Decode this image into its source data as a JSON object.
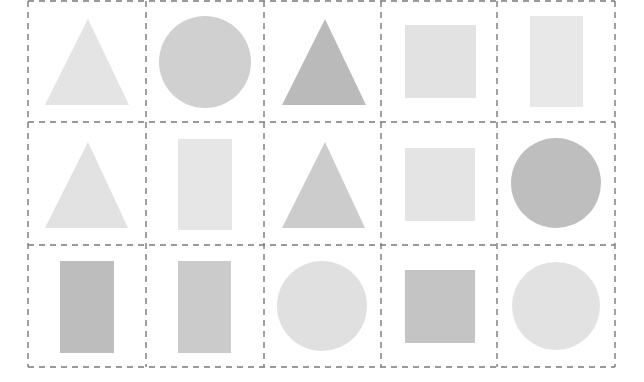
{
  "grid": {
    "rows": 3,
    "cols": 5,
    "x_lines": [
      28,
      146,
      264,
      381,
      497,
      615
    ],
    "y_lines": [
      1,
      122,
      245,
      367
    ],
    "line_color": "#7a7a7a",
    "dash": "6,5"
  },
  "cells": [
    {
      "row": 0,
      "col": 0,
      "shape": "triangle",
      "points": "88,19 45,105 129,105",
      "color": "#e4e4e4"
    },
    {
      "row": 0,
      "col": 1,
      "shape": "circle",
      "cx": 205,
      "cy": 62,
      "r": 46,
      "color": "#d0d0d0"
    },
    {
      "row": 0,
      "col": 2,
      "shape": "triangle",
      "points": "325,19 282,105 366,105",
      "color": "#bababa"
    },
    {
      "row": 0,
      "col": 3,
      "shape": "square",
      "x": 405,
      "y": 25,
      "w": 71,
      "h": 73,
      "color": "#e2e2e2"
    },
    {
      "row": 0,
      "col": 4,
      "shape": "rectangle",
      "x": 530,
      "y": 16,
      "w": 53,
      "h": 91,
      "color": "#e8e8e8"
    },
    {
      "row": 1,
      "col": 0,
      "shape": "triangle",
      "points": "88,142 45,228 128,228",
      "color": "#e2e2e2"
    },
    {
      "row": 1,
      "col": 1,
      "shape": "rectangle",
      "x": 178,
      "y": 139,
      "w": 54,
      "h": 91,
      "color": "#e6e6e6"
    },
    {
      "row": 1,
      "col": 2,
      "shape": "triangle",
      "points": "325,142 282,228 365,228",
      "color": "#cccccc"
    },
    {
      "row": 1,
      "col": 3,
      "shape": "square",
      "x": 405,
      "y": 148,
      "w": 70,
      "h": 73,
      "color": "#e4e4e4"
    },
    {
      "row": 1,
      "col": 4,
      "shape": "circle",
      "cx": 556,
      "cy": 183,
      "r": 45,
      "color": "#bebebe"
    },
    {
      "row": 2,
      "col": 0,
      "shape": "rectangle",
      "x": 60,
      "y": 261,
      "w": 54,
      "h": 92,
      "color": "#bdbdbd"
    },
    {
      "row": 2,
      "col": 1,
      "shape": "rectangle",
      "x": 178,
      "y": 261,
      "w": 53,
      "h": 92,
      "color": "#cbcbcb"
    },
    {
      "row": 2,
      "col": 2,
      "shape": "circle",
      "cx": 322,
      "cy": 306,
      "r": 45,
      "color": "#e0e0e0"
    },
    {
      "row": 2,
      "col": 3,
      "shape": "square",
      "x": 405,
      "y": 270,
      "w": 70,
      "h": 73,
      "color": "#c4c4c4"
    },
    {
      "row": 2,
      "col": 4,
      "shape": "circle",
      "cx": 556,
      "cy": 306,
      "r": 44,
      "color": "#e2e2e2"
    }
  ]
}
